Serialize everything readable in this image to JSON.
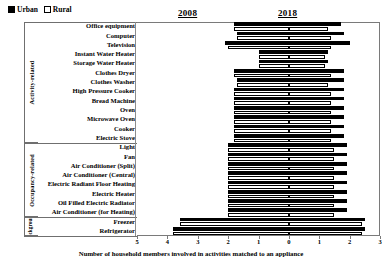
{
  "legend": {
    "items": [
      {
        "label": "Urban",
        "swatch": "filled-black"
      },
      {
        "label": "Rural",
        "swatch": "open-white"
      }
    ]
  },
  "headers": {
    "left_year": "2008",
    "right_year": "2018"
  },
  "groups": [
    {
      "name": "Activity-related",
      "label": "Activity-related"
    },
    {
      "name": "Occupancy-related",
      "label": "Occupancy-related"
    },
    {
      "name": "Background",
      "label": "Background"
    }
  ],
  "chart_data": {
    "type": "bar",
    "orientation": "horizontal-diverging",
    "title": "",
    "subtitle": "",
    "xlabel": "Number of household members involved in activities matched to an appliance",
    "ylabel": "",
    "xticks": [
      5,
      4,
      3,
      2,
      1,
      0,
      1,
      2,
      3
    ],
    "xlim": [
      -5,
      3
    ],
    "left_panel_label": "2008",
    "right_panel_label": "2018",
    "grid": false,
    "legend_position": "top-left",
    "series": [
      {
        "name": "Urban",
        "color": "#000000",
        "style": "filled"
      },
      {
        "name": "Rural",
        "color": "#ffffff",
        "style": "outlined"
      }
    ],
    "categories": [
      "Office equipment",
      "Computer",
      "Television",
      "Instant Water Heater",
      "Storage Water Heater",
      "Clothes Dryer",
      "Clothes Washer",
      "High Pressure Cooker",
      "Bread Machine",
      "Oven",
      "Microwave Oven",
      "Cooker",
      "Electric Stove",
      "Light",
      "Fan",
      "Air Conditioner (Split)",
      "Air Conditioner (Central)",
      "Electric Radiant Floor Heating",
      "Electric Heater",
      "Oil Filled Electric Radiator",
      "Air Conditioner (for Heating)",
      "Freezer",
      "Refrigerator"
    ],
    "category_groups": [
      "Activity-related",
      "Activity-related",
      "Activity-related",
      "Activity-related",
      "Activity-related",
      "Activity-related",
      "Activity-related",
      "Activity-related",
      "Activity-related",
      "Activity-related",
      "Activity-related",
      "Activity-related",
      "Activity-related",
      "Occupancy-related",
      "Occupancy-related",
      "Occupancy-related",
      "Occupancy-related",
      "Occupancy-related",
      "Occupancy-related",
      "Occupancy-related",
      "Occupancy-related",
      "Background",
      "Background"
    ],
    "data": [
      {
        "category": "Office equipment",
        "urban_2008": 1.8,
        "urban_2018": 1.7,
        "rural_2008": 1.8,
        "rural_2018": 1.3
      },
      {
        "category": "Computer",
        "urban_2008": 1.7,
        "urban_2018": 1.8,
        "rural_2008": 1.7,
        "rural_2018": 1.4
      },
      {
        "category": "Television",
        "urban_2008": 2.1,
        "urban_2018": 2.0,
        "rural_2008": 2.0,
        "rural_2018": 1.4
      },
      {
        "category": "Instant Water Heater",
        "urban_2008": 1.0,
        "urban_2018": 1.3,
        "rural_2008": 1.0,
        "rural_2018": 1.2
      },
      {
        "category": "Storage Water Heater",
        "urban_2008": 1.0,
        "urban_2018": 1.3,
        "rural_2008": 1.0,
        "rural_2018": 1.2
      },
      {
        "category": "Clothes Dryer",
        "urban_2008": 1.8,
        "urban_2018": 1.8,
        "rural_2008": 1.8,
        "rural_2018": 1.4
      },
      {
        "category": "Clothes Washer",
        "urban_2008": 1.7,
        "urban_2018": 1.8,
        "rural_2008": 1.7,
        "rural_2018": 1.3
      },
      {
        "category": "High Pressure Cooker",
        "urban_2008": 1.8,
        "urban_2018": 1.8,
        "rural_2008": 1.8,
        "rural_2018": 1.4
      },
      {
        "category": "Bread Machine",
        "urban_2008": 1.8,
        "urban_2018": 1.8,
        "rural_2008": 1.8,
        "rural_2018": 1.4
      },
      {
        "category": "Oven",
        "urban_2008": 1.8,
        "urban_2018": 1.8,
        "rural_2008": 1.8,
        "rural_2018": 1.4
      },
      {
        "category": "Microwave Oven",
        "urban_2008": 1.8,
        "urban_2018": 1.8,
        "rural_2008": 1.8,
        "rural_2018": 1.4
      },
      {
        "category": "Cooker",
        "urban_2008": 1.8,
        "urban_2018": 1.8,
        "rural_2008": 1.8,
        "rural_2018": 1.4
      },
      {
        "category": "Electric Stove",
        "urban_2008": 1.8,
        "urban_2018": 1.8,
        "rural_2008": 1.8,
        "rural_2018": 1.4
      },
      {
        "category": "Light",
        "urban_2008": 2.0,
        "urban_2018": 1.9,
        "rural_2008": 2.0,
        "rural_2018": 1.5
      },
      {
        "category": "Fan",
        "urban_2008": 2.0,
        "urban_2018": 1.9,
        "rural_2008": 2.0,
        "rural_2018": 1.5
      },
      {
        "category": "Air Conditioner (Split)",
        "urban_2008": 2.0,
        "urban_2018": 1.9,
        "rural_2008": 2.0,
        "rural_2018": 1.5
      },
      {
        "category": "Air Conditioner (Central)",
        "urban_2008": 2.0,
        "urban_2018": 1.9,
        "rural_2008": 2.0,
        "rural_2018": 1.5
      },
      {
        "category": "Electric Radiant Floor Heating",
        "urban_2008": 2.0,
        "urban_2018": 1.9,
        "rural_2008": 2.0,
        "rural_2018": 1.5
      },
      {
        "category": "Electric Heater",
        "urban_2008": 2.0,
        "urban_2018": 1.9,
        "rural_2008": 2.0,
        "rural_2018": 1.5
      },
      {
        "category": "Oil Filled Electric Radiator",
        "urban_2008": 2.0,
        "urban_2018": 1.9,
        "rural_2008": 2.0,
        "rural_2018": 1.5
      },
      {
        "category": "Air Conditioner (for Heating)",
        "urban_2008": 2.0,
        "urban_2018": 1.9,
        "rural_2008": 2.0,
        "rural_2018": 1.5
      },
      {
        "category": "Freezer",
        "urban_2008": 3.6,
        "urban_2018": 2.5,
        "rural_2008": 3.6,
        "rural_2018": 2.4
      },
      {
        "category": "Refrigerator",
        "urban_2008": 3.8,
        "urban_2018": 2.5,
        "rural_2008": 3.8,
        "rural_2018": 2.4
      }
    ]
  }
}
